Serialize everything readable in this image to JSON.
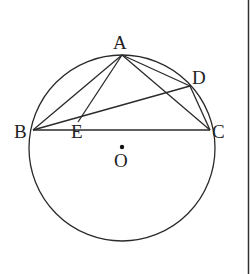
{
  "figure": {
    "type": "geometry",
    "points": {
      "A": {
        "label": "A",
        "x": 122,
        "y": 55
      },
      "B": {
        "label": "B",
        "x": 33,
        "y": 130
      },
      "C": {
        "label": "C",
        "x": 210,
        "y": 130
      },
      "D": {
        "label": "D",
        "x": 190,
        "y": 86
      },
      "E": {
        "label": "E",
        "x": 80,
        "y": 117
      },
      "O": {
        "label": "O",
        "x": 122,
        "y": 147
      }
    },
    "circle": {
      "center": "O",
      "cx": 122,
      "cy": 148,
      "r": 93
    },
    "segments": [
      "AB",
      "AC",
      "AD",
      "AE",
      "BD",
      "BC",
      "DC"
    ],
    "colors": {
      "stroke": "#2a2a2a",
      "background": "#ffffff"
    }
  }
}
